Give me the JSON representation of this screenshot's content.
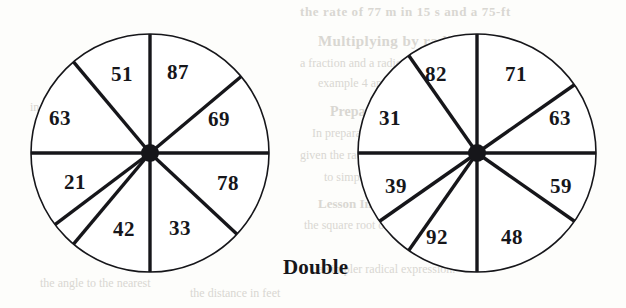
{
  "page": {
    "background_color": "#fdfdfb",
    "ink_color": "#16161a",
    "bleed_color": "#d9d7d2",
    "caption": "Double"
  },
  "chart_data": {
    "type": "pie",
    "title": "Double",
    "xlabel": "",
    "ylabel": "",
    "grid": false,
    "legend": "none",
    "note": "Two eight-sector spinners; each sector is labelled with a two-digit number.",
    "charts": [
      {
        "name": "left-spinner",
        "type": "pie",
        "sector_count": 8,
        "center": {
          "x": 150,
          "y": 153
        },
        "radius": 119,
        "categories": [
          "51",
          "69",
          "78",
          "33",
          "42",
          "21",
          "63",
          "87"
        ],
        "values": [
          51,
          69,
          78,
          33,
          42,
          21,
          63,
          87
        ],
        "sectors": [
          {
            "label": "51",
            "start_deg": 90,
            "end_deg": 130,
            "label_x": 122,
            "label_y": 74
          },
          {
            "label": "87",
            "start_deg": 130,
            "end_deg": 180,
            "label_x": 178,
            "label_y": 72
          },
          {
            "label": "69",
            "start_deg": 40,
            "end_deg": 90,
            "label_x": 219,
            "label_y": 119
          },
          {
            "label": "63",
            "start_deg": 180,
            "end_deg": 217,
            "label_x": 60,
            "label_y": 118
          },
          {
            "label": "78",
            "start_deg": 317,
            "end_deg": 360,
            "label_x": 228,
            "label_y": 183
          },
          {
            "label": "21",
            "start_deg": 180,
            "end_deg": 230,
            "label_x": 75,
            "label_y": 182
          },
          {
            "label": "33",
            "start_deg": 270,
            "end_deg": 317,
            "label_x": 180,
            "label_y": 228
          },
          {
            "label": "42",
            "start_deg": 230,
            "end_deg": 270,
            "label_x": 124,
            "label_y": 229
          }
        ]
      },
      {
        "name": "right-spinner",
        "type": "pie",
        "sector_count": 8,
        "center": {
          "x": 477,
          "y": 153
        },
        "radius": 119,
        "categories": [
          "71",
          "63",
          "59",
          "48",
          "92",
          "39",
          "31",
          "82"
        ],
        "values": [
          71,
          63,
          59,
          48,
          92,
          39,
          31,
          82
        ],
        "sectors": [
          {
            "label": "71",
            "start_deg": 90,
            "end_deg": 125,
            "label_x": 516,
            "label_y": 74
          },
          {
            "label": "82",
            "start_deg": 125,
            "end_deg": 180,
            "label_x": 436,
            "label_y": 74
          },
          {
            "label": "63",
            "start_deg": 35,
            "end_deg": 90,
            "label_x": 560,
            "label_y": 118
          },
          {
            "label": "31",
            "start_deg": 180,
            "end_deg": 215,
            "label_x": 390,
            "label_y": 118
          },
          {
            "label": "59",
            "start_deg": 325,
            "end_deg": 360,
            "label_x": 561,
            "label_y": 186
          },
          {
            "label": "39",
            "start_deg": 180,
            "end_deg": 235,
            "label_x": 396,
            "label_y": 186
          },
          {
            "label": "48",
            "start_deg": 270,
            "end_deg": 325,
            "label_x": 512,
            "label_y": 237
          },
          {
            "label": "92",
            "start_deg": 235,
            "end_deg": 270,
            "label_x": 437,
            "label_y": 237
          }
        ]
      }
    ]
  },
  "bleed_text": {
    "lines": [
      "the rate of 77 m in 15 s and a 75-ft",
      "Multiplying by radicals",
      "a fraction and a radical in the",
      "example 4 and 5 both make",
      "Preparation",
      "In preparation for",
      "given the radius and",
      "to simplify",
      "Lesson Investigation",
      "the square root of a",
      "a simpler radical expression.",
      "in terms of the given",
      "given the value of x",
      "find the exact value of",
      "the angle to the nearest",
      "the distance in feet"
    ]
  }
}
